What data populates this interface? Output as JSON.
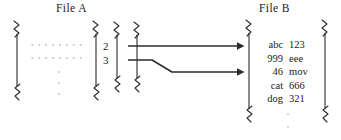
{
  "diagram": {
    "file_a": {
      "title": "File A",
      "row_indices": [
        "2",
        "3"
      ],
      "ellipsis_dots": 3,
      "dotted_rows": 2
    },
    "file_b": {
      "title": "File B",
      "columns": [
        "key",
        "value"
      ],
      "rows": [
        {
          "key": "abc",
          "value": "123"
        },
        {
          "key": "999",
          "value": "eee"
        },
        {
          "key": "46",
          "value": "mov"
        },
        {
          "key": "cat",
          "value": "666"
        },
        {
          "key": "dog",
          "value": "321"
        }
      ],
      "ellipsis_dots": 2
    },
    "arrows": [
      {
        "name": "arrow-row-2-to-file-b-line-1",
        "from_row": "2",
        "shape": "straight"
      },
      {
        "name": "arrow-row-3-to-file-b-line-3",
        "from_row": "3",
        "shape": "diagonal-then-straight"
      }
    ],
    "colors": {
      "ink": "#1a1a1a",
      "line": "#2b2b2b",
      "faint": "#b9b9b9",
      "background": "#ffffff"
    }
  }
}
